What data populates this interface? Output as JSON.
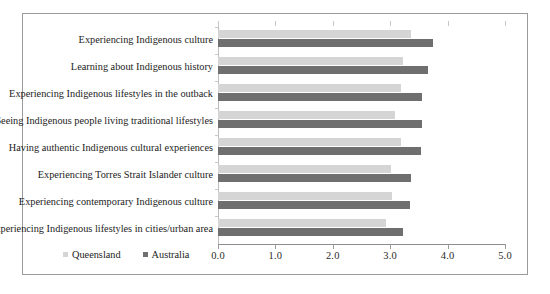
{
  "chart_data": {
    "type": "bar",
    "orientation": "horizontal",
    "title": "",
    "xlabel": "",
    "ylabel": "",
    "xlim": [
      0.0,
      5.0
    ],
    "xticks": [
      "0.0",
      "1.0",
      "2.0",
      "3.0",
      "4.0",
      "5.0"
    ],
    "grid": false,
    "legend_position": "bottom-left",
    "categories": [
      "Experiencing Indigenous culture",
      "Learning about Indigenous history",
      "Experiencing Indigenous lifestyles in the outback",
      "Seeing Indigenous people living traditional lifestyles",
      "Having authentic Indigenous cultural experiences",
      "Experiencing Torres Strait Islander culture",
      "Experiencing contemporary Indigenous culture",
      "Experiencing Indigenous lifestyles in cities/urban area"
    ],
    "series": [
      {
        "name": "Queensland",
        "color": "#d5d5d5",
        "values": [
          3.37,
          3.23,
          3.18,
          3.08,
          3.18,
          3.02,
          3.04,
          2.92
        ]
      },
      {
        "name": "Australia",
        "color": "#6f6f6f",
        "values": [
          3.74,
          3.65,
          3.55,
          3.55,
          3.53,
          3.37,
          3.34,
          3.23
        ]
      }
    ]
  },
  "legend": {
    "items": [
      {
        "label": "Queensland",
        "swatch": "qld"
      },
      {
        "label": "Australia",
        "swatch": "aus"
      }
    ]
  }
}
